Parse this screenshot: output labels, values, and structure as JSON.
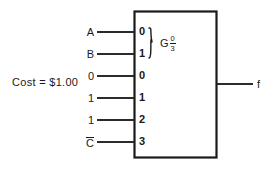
{
  "figure": {
    "type": "logic-circuit-schematic",
    "cost_label": "Cost = $1.00"
  },
  "colors": {
    "background": "#ffffff",
    "ink": "#1a1a1a",
    "wire": "#2b2b2b"
  },
  "block": {
    "name": "mux-block",
    "x": 134,
    "y": 11,
    "width": 83,
    "height": 147,
    "group_label": {
      "letter": "G",
      "fraction_numerator": "0",
      "fraction_denominator": "3"
    },
    "brace": {
      "name": "select-group-brace",
      "spans_pins": [
        "0",
        "1"
      ]
    }
  },
  "inputs": [
    {
      "signal": "A",
      "pin": "0",
      "y": 32,
      "group": "select",
      "overbar": false
    },
    {
      "signal": "B",
      "pin": "1",
      "y": 54,
      "group": "select",
      "overbar": false
    },
    {
      "signal": "0",
      "pin": "0",
      "y": 76,
      "group": "data",
      "overbar": false
    },
    {
      "signal": "1",
      "pin": "1",
      "y": 98,
      "group": "data",
      "overbar": false
    },
    {
      "signal": "1",
      "pin": "2",
      "y": 120,
      "group": "data",
      "overbar": false
    },
    {
      "signal": "C",
      "pin": "3",
      "y": 142,
      "group": "data",
      "overbar": true
    }
  ],
  "output": {
    "label": "f",
    "y": 84
  }
}
